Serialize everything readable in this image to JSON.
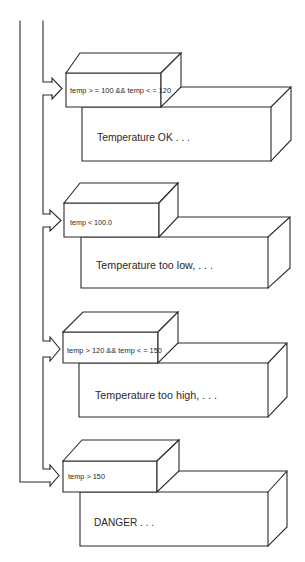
{
  "diagram": {
    "branches": [
      {
        "condition": "temp > = 100 && temp < = 120",
        "action": "Temperature OK . . ."
      },
      {
        "condition": "temp < 100.0",
        "action": "Temperature too low, . . ."
      },
      {
        "condition": "temp > 120 && temp < = 150",
        "action": "Temperature too high, . . ."
      },
      {
        "condition": "temp > 150",
        "action": "DANGER . . ."
      }
    ]
  },
  "colors": {
    "background": "#ffffff",
    "line": "#2a2a2a",
    "text": "#2a2a2a"
  }
}
